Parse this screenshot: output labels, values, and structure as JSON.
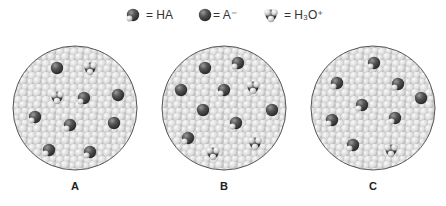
{
  "legend": {
    "items": [
      {
        "key": "HA",
        "label": "= HA",
        "icon": "ha-molecule",
        "x": 125
      },
      {
        "key": "A",
        "label": "= A⁻",
        "icon": "a-minus-ion",
        "x": 197
      },
      {
        "key": "H3O",
        "label": "= H₃O⁺",
        "icon": "hydronium-ion",
        "x": 263
      }
    ]
  },
  "colors": {
    "water_light": "#e6e6e6",
    "water_mid": "#c8c8c8",
    "dark_sphere": "#4a4a4a",
    "light_atom": "#d8d8d8",
    "circle_border": "#555555",
    "text": "#333333"
  },
  "panels": [
    {
      "label": "A",
      "cx": 75,
      "cy": 108,
      "r": 62,
      "molecules": [
        {
          "type": "A",
          "x": 57,
          "y": 68
        },
        {
          "type": "H3O",
          "x": 90,
          "y": 68
        },
        {
          "type": "H3O",
          "x": 57,
          "y": 97
        },
        {
          "type": "HA",
          "x": 84,
          "y": 98
        },
        {
          "type": "A",
          "x": 118,
          "y": 95
        },
        {
          "type": "HA",
          "x": 35,
          "y": 117
        },
        {
          "type": "HA",
          "x": 70,
          "y": 125
        },
        {
          "type": "A",
          "x": 114,
          "y": 123
        },
        {
          "type": "HA",
          "x": 49,
          "y": 150
        },
        {
          "type": "HA",
          "x": 90,
          "y": 152
        }
      ]
    },
    {
      "label": "B",
      "cx": 224,
      "cy": 108,
      "r": 62,
      "molecules": [
        {
          "type": "A",
          "x": 205,
          "y": 68
        },
        {
          "type": "HA",
          "x": 238,
          "y": 63
        },
        {
          "type": "A",
          "x": 181,
          "y": 90
        },
        {
          "type": "HA",
          "x": 224,
          "y": 90
        },
        {
          "type": "H3O",
          "x": 253,
          "y": 87
        },
        {
          "type": "A",
          "x": 203,
          "y": 110
        },
        {
          "type": "A",
          "x": 272,
          "y": 110
        },
        {
          "type": "HA",
          "x": 236,
          "y": 123
        },
        {
          "type": "HA",
          "x": 188,
          "y": 138
        },
        {
          "type": "H3O",
          "x": 255,
          "y": 143
        },
        {
          "type": "H3O",
          "x": 213,
          "y": 153
        }
      ]
    },
    {
      "label": "C",
      "cx": 373,
      "cy": 108,
      "r": 62,
      "molecules": [
        {
          "type": "HA",
          "x": 374,
          "y": 63
        },
        {
          "type": "HA",
          "x": 337,
          "y": 83
        },
        {
          "type": "HA",
          "x": 398,
          "y": 84
        },
        {
          "type": "A",
          "x": 421,
          "y": 98
        },
        {
          "type": "HA",
          "x": 362,
          "y": 105
        },
        {
          "type": "HA",
          "x": 332,
          "y": 120
        },
        {
          "type": "HA",
          "x": 395,
          "y": 118
        },
        {
          "type": "HA",
          "x": 353,
          "y": 145
        },
        {
          "type": "H3O",
          "x": 391,
          "y": 150
        }
      ]
    }
  ]
}
